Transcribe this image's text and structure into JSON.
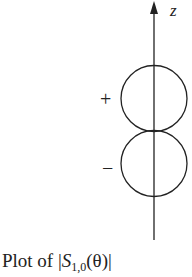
{
  "diagram": {
    "axis_label": "z",
    "upper_lobe_sign": "+",
    "lower_lobe_sign": "−",
    "caption": {
      "prefix": "Plot of |",
      "symbol": "S",
      "subscript": "1,0",
      "argument": "(θ)|"
    }
  }
}
